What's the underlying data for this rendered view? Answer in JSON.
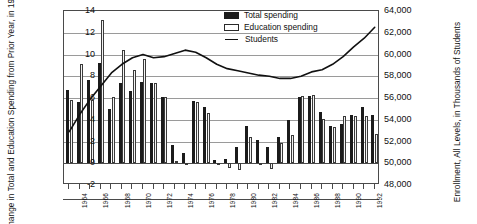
{
  "chart_data": {
    "type": "bar",
    "title": "",
    "subtitle": "",
    "xlabel": "",
    "ylabel": "Percent Change in Total and Education Spending from Prior Year, in 1992 Dollars",
    "ylabel_right": "Enrollment, All Levels, in Thousands of Students",
    "ylim": [
      -2,
      14
    ],
    "yticks": [
      -2,
      0,
      2,
      4,
      6,
      8,
      10,
      12,
      14
    ],
    "ylim_right": [
      48000,
      64000
    ],
    "yticks_right": [
      "48,000",
      "50,000",
      "52,000",
      "54,000",
      "56,000",
      "58,000",
      "60,000",
      "62,000",
      "64,000"
    ],
    "grid": true,
    "legend_position": "top-right",
    "categories": [
      "1963",
      "1964",
      "1965",
      "1966",
      "1967",
      "1968",
      "1969",
      "1970",
      "1971",
      "1972",
      "1973",
      "1974",
      "1975",
      "1976",
      "1977",
      "1978",
      "1979",
      "1980",
      "1981",
      "1982",
      "1983",
      "1984",
      "1985",
      "1986",
      "1987",
      "1988",
      "1989",
      "1990",
      "1991",
      "1992"
    ],
    "tick_labels": [
      "1964",
      "1966",
      "1968",
      "1970",
      "1972",
      "1974",
      "1976",
      "1978",
      "1980",
      "1982",
      "1984",
      "1986",
      "1988",
      "1990",
      "1992"
    ],
    "series": [
      {
        "name": "Total spending",
        "color": "#1b1b1b",
        "type": "bar",
        "values": [
          6.7,
          5.6,
          7.7,
          9.2,
          5.0,
          7.4,
          6.6,
          7.5,
          7.4,
          6.1,
          1.7,
          0.9,
          5.7,
          5.2,
          0.3,
          0.4,
          1.5,
          3.4,
          2.1,
          1.5,
          2.4,
          4.0,
          6.1,
          6.2,
          4.7,
          3.4,
          3.6,
          4.4,
          5.2,
          4.4
        ]
      },
      {
        "name": "Education spending",
        "color": "#f4f4f4",
        "type": "bar",
        "values": [
          5.8,
          9.1,
          5.8,
          13.2,
          6.1,
          10.4,
          8.6,
          9.6,
          7.4,
          6.1,
          0.2,
          0.0,
          5.6,
          4.6,
          0.0,
          -0.4,
          -0.6,
          2.4,
          -0.2,
          -0.5,
          1.9,
          2.6,
          6.2,
          6.3,
          4.1,
          3.3,
          4.3,
          4.3,
          4.3,
          2.7
        ]
      },
      {
        "name": "Students",
        "color": "#111111",
        "type": "line",
        "axis": "right",
        "values": [
          52900,
          54500,
          55900,
          57100,
          58300,
          59100,
          59700,
          60000,
          59700,
          59800,
          60100,
          60400,
          60200,
          59700,
          59100,
          58700,
          58500,
          58300,
          58100,
          58000,
          57800,
          57800,
          58000,
          58400,
          58600,
          59100,
          59800,
          60700,
          61500,
          62500
        ]
      }
    ]
  },
  "legend": {
    "items": [
      {
        "label": "Total spending",
        "swatch": "filled-square"
      },
      {
        "label": "Education spending",
        "swatch": "open-square"
      },
      {
        "label": "Students",
        "swatch": "line"
      }
    ]
  },
  "axes": {
    "left_title": "Percent Change in Total and Education Spending from Prior Year, in 1992 Dollars",
    "right_title": "Enrollment, All Levels, in Thousands of Students"
  }
}
